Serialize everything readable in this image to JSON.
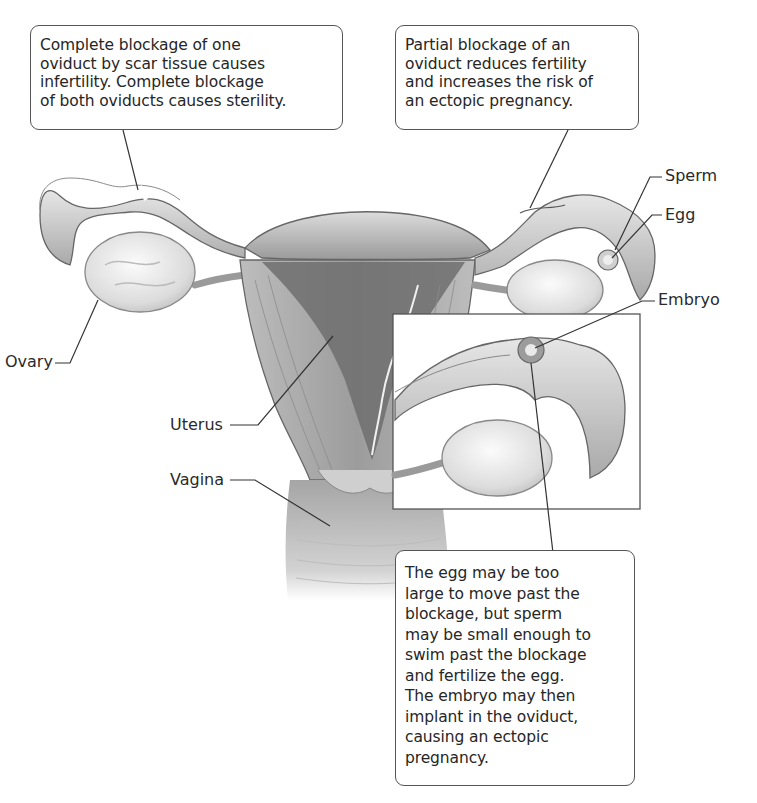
{
  "callouts": {
    "complete_blockage": {
      "lines": [
        "Complete blockage of one",
        "oviduct by scar tissue causes",
        "infertility. Complete blockage",
        "of both oviducts causes sterility."
      ]
    },
    "partial_blockage": {
      "lines": [
        "Partial blockage of an",
        "oviduct reduces fertility",
        "and increases the risk of",
        "an ectopic pregnancy."
      ]
    },
    "ectopic_explanation": {
      "lines": [
        "The egg may be too",
        "large to move past the",
        "blockage, but sperm",
        "may be small enough to",
        "swim past the blockage",
        "and fertilize the egg.",
        "The embryo may then",
        "implant in the oviduct,",
        "causing an ectopic",
        "pregnancy."
      ]
    }
  },
  "labels": {
    "sperm": "Sperm",
    "egg": "Egg",
    "embryo": "Embryo",
    "ovary": "Ovary",
    "uterus": "Uterus",
    "vagina": "Vagina"
  },
  "colors": {
    "tissue_light": "#d9d9d9",
    "tissue_mid": "#b5b5b5",
    "tissue_dark": "#7a7a7a",
    "outline": "#555555",
    "leader_line": "#333333"
  }
}
